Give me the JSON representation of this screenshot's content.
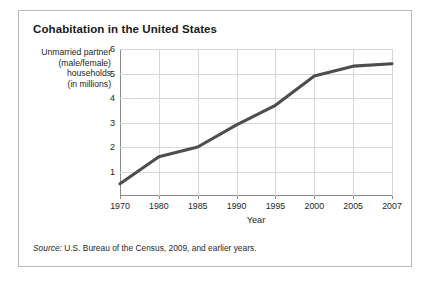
{
  "figure": {
    "title": "Cohabitation in the United States",
    "source_label": "Source:",
    "source_text": " U.S. Bureau of the Census, 2009, and earlier years."
  },
  "chart_data": {
    "type": "line",
    "title": "Cohabitation in the United States",
    "xlabel": "Year",
    "ylabel": "Unmarried partner (male/female) households (in millions)",
    "ylabel_lines": [
      "Unmarried partner",
      "(male/female)",
      "households",
      "(in millions)"
    ],
    "categories": [
      "1970",
      "1980",
      "1985",
      "1990",
      "1995",
      "2000",
      "2005",
      "2007"
    ],
    "values": [
      0.5,
      1.6,
      2.0,
      2.9,
      3.7,
      4.9,
      5.3,
      5.4
    ],
    "series": [
      {
        "name": "Unmarried partner (male/female) households (in millions)",
        "values": [
          0.5,
          1.6,
          2.0,
          2.9,
          3.7,
          4.9,
          5.3,
          5.4
        ]
      }
    ],
    "y_ticks": [
      1,
      2,
      3,
      4,
      5,
      6
    ],
    "ylim": [
      0,
      6
    ],
    "x_tick_labels": [
      "1970",
      "1980",
      "1985",
      "1990",
      "1995",
      "2000",
      "2005",
      "2007"
    ],
    "grid": true,
    "legend": "none",
    "line_color": "#4d4d4d",
    "grid_color": "#d7d7d7",
    "axis_color": "#8a8a8a"
  }
}
